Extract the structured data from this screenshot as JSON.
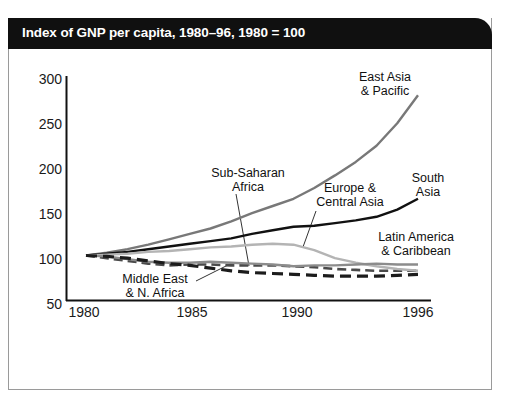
{
  "title": "Index of GNP per capita, 1980–96, 1980 = 100",
  "axes": {
    "y_ticks": [
      "300",
      "250",
      "200",
      "150",
      "100",
      "50"
    ],
    "x_ticks": [
      "1980",
      "1985",
      "1990",
      "1996"
    ]
  },
  "annotations": {
    "east_asia": {
      "line1": "East Asia",
      "line2": "& Pacific"
    },
    "sub_saharan": {
      "line1": "Sub-Saharan",
      "line2": "Africa"
    },
    "europe": {
      "line1": "Europe &",
      "line2": "Central Asia"
    },
    "south_asia": {
      "line1": "South",
      "line2": "Asia"
    },
    "latin_america": {
      "line1": "Latin America",
      "line2": "& Caribbean"
    },
    "middle_east": {
      "line1": "Middle East",
      "line2": "& N. Africa"
    }
  },
  "colors": {
    "banner": "#101010",
    "banner_text": "#ffffff",
    "frame": "#9a9a9a",
    "axis": "#111111",
    "east_asia": "#787878",
    "south_asia": "#111111",
    "sub_saharan": "#4a4a4a",
    "europe": "#b4b4b4",
    "latin_america": "#8c8c8c",
    "middle_east": "#1c1c1c"
  },
  "chart_data": {
    "type": "line",
    "title": "Index of GNP per capita, 1980–96, 1980 = 100",
    "xlabel": "",
    "ylabel": "",
    "xlim": [
      1980,
      1996
    ],
    "ylim": [
      50,
      300
    ],
    "grid": false,
    "legend": "annotations-inline",
    "x": [
      1980,
      1981,
      1982,
      1983,
      1984,
      1985,
      1986,
      1987,
      1988,
      1989,
      1990,
      1991,
      1992,
      1993,
      1994,
      1995,
      1996
    ],
    "series": [
      {
        "name": "East Asia & Pacific",
        "style": "solid",
        "color": "#787878",
        "values": [
          100,
          103,
          107,
          112,
          118,
          124,
          130,
          138,
          147,
          155,
          163,
          175,
          189,
          204,
          222,
          247,
          278
        ]
      },
      {
        "name": "South Asia",
        "style": "solid",
        "color": "#111111",
        "values": [
          100,
          102,
          104,
          107,
          110,
          113,
          116,
          119,
          124,
          128,
          132,
          133,
          136,
          139,
          143,
          151,
          163
        ]
      },
      {
        "name": "Sub-Saharan Africa",
        "style": "dashed",
        "color": "#4a4a4a",
        "values": [
          100,
          97,
          94,
          91,
          89,
          90,
          90,
          89,
          89,
          89,
          88,
          87,
          85,
          84,
          83,
          83,
          83
        ]
      },
      {
        "name": "Europe & Central Asia",
        "style": "solid",
        "color": "#b4b4b4",
        "values": [
          100,
          101,
          102,
          104,
          105,
          107,
          109,
          110,
          112,
          113,
          112,
          106,
          97,
          92,
          88,
          85,
          83
        ]
      },
      {
        "name": "Latin America & Caribbean",
        "style": "solid",
        "color": "#8c8c8c",
        "values": [
          100,
          99,
          96,
          93,
          92,
          92,
          93,
          92,
          91,
          90,
          88,
          89,
          89,
          90,
          91,
          90,
          90
        ]
      },
      {
        "name": "Middle East & N. Africa",
        "style": "dashed-bold",
        "color": "#1c1c1c",
        "values": [
          100,
          99,
          97,
          94,
          91,
          89,
          86,
          83,
          81,
          80,
          79,
          78,
          77,
          77,
          77,
          78,
          79
        ]
      }
    ]
  }
}
